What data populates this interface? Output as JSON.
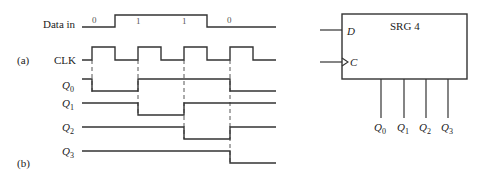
{
  "labels": {
    "part_a": "(a)",
    "part_b": "(b)",
    "data_in": "Data in",
    "clk": "CLK",
    "q_letter": "Q",
    "q_subs": [
      "0",
      "1",
      "2",
      "3"
    ]
  },
  "data_bits": [
    "0",
    "1",
    "1",
    "0"
  ],
  "block": {
    "title": "SRG 4",
    "input_d": "D",
    "input_c": "C",
    "outputs": [
      {
        "letter": "Q",
        "sub": "0"
      },
      {
        "letter": "Q",
        "sub": "1"
      },
      {
        "letter": "Q",
        "sub": "2"
      },
      {
        "letter": "Q",
        "sub": "3"
      }
    ]
  },
  "timing": {
    "clock_rising_edges_x": [
      92,
      138,
      184,
      230
    ],
    "signals": {
      "data_in": [
        0,
        1,
        1,
        0
      ],
      "q0_after_edges": [
        0,
        1,
        1,
        0
      ],
      "q1_after_edges": [
        1,
        0,
        1,
        1
      ],
      "q2_after_edges": [
        1,
        1,
        0,
        1
      ],
      "q3_after_edges": [
        1,
        1,
        1,
        0
      ]
    }
  }
}
